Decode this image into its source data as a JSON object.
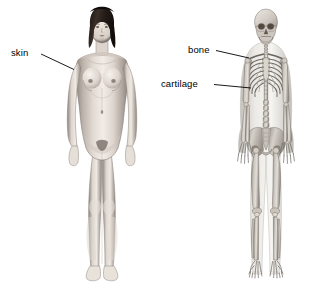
{
  "figure": {
    "background_color": "#ffffff",
    "width": 327,
    "height": 285,
    "caption": "",
    "subjects": [
      {
        "name": "female-body-skin-view",
        "description": "Anterior view of an adult female human body, nude, showing external skin surface",
        "position": "left",
        "hair_color": "#2b2320",
        "skin_color": "#cfc6bf"
      },
      {
        "name": "skeleton-view",
        "description": "Anterior view of the human skeleton within a translucent body outline",
        "position": "right",
        "bone_color": "#b9b4ac",
        "outline_color": "#d8d5cf"
      }
    ]
  },
  "labels": [
    {
      "id": "skin",
      "text": "skin",
      "target": "left figure shoulder / external body surface"
    },
    {
      "id": "bone",
      "text": "bone",
      "target": "rib bone of the thoracic cage"
    },
    {
      "id": "cartilage",
      "text": "cartilage",
      "target": "costal cartilage of the lower ribs"
    }
  ],
  "skeleton_parts": [
    "skull",
    "mandible",
    "cervical vertebrae",
    "clavicle",
    "scapula",
    "sternum",
    "ribs",
    "costal cartilage",
    "thoracic vertebrae",
    "lumbar vertebrae",
    "humerus",
    "radius",
    "ulna",
    "carpals",
    "metacarpals",
    "phalanges",
    "pelvis",
    "ilium",
    "sacrum",
    "femur",
    "patella",
    "tibia",
    "fibula",
    "tarsals",
    "metatarsals"
  ],
  "style": {
    "label_color": "#000000",
    "leader_line_color": "#000000",
    "label_font_size_px": 9.5
  }
}
